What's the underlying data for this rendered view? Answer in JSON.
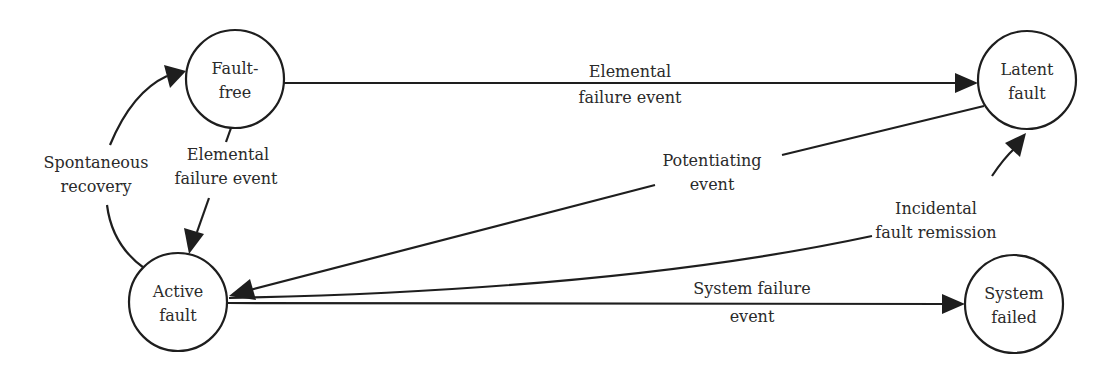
{
  "diagram": {
    "type": "state-transition",
    "nodes": {
      "fault_free": {
        "line1": "Fault-",
        "line2": "free"
      },
      "latent_fault": {
        "line1": "Latent",
        "line2": "fault"
      },
      "active_fault": {
        "line1": "Active",
        "line2": "fault"
      },
      "system_failed": {
        "line1": "System",
        "line2": "failed"
      }
    },
    "edges": {
      "fault_free_to_latent": {
        "line1": "Elemental",
        "line2": "failure event"
      },
      "fault_free_to_active": {
        "line1": "Elemental",
        "line2": "failure event"
      },
      "active_to_fault_free": {
        "line1": "Spontaneous",
        "line2": "recovery"
      },
      "latent_to_active": {
        "line1": "Potentiating",
        "line2": "event"
      },
      "active_to_latent": {
        "line1": "Incidental",
        "line2": "fault remission"
      },
      "active_to_system_failed": {
        "line1": "System failure",
        "line2": "event"
      }
    },
    "colors": {
      "stroke": "#1e1e1e",
      "text": "#2a2a2a",
      "background": "#ffffff"
    }
  }
}
